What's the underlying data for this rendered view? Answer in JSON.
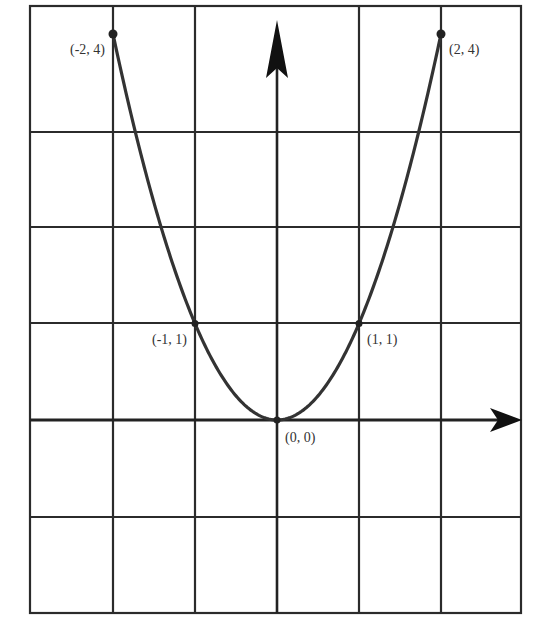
{
  "chart_data": {
    "type": "line",
    "title": "",
    "function": "y = x^2",
    "xlabel": "",
    "ylabel": "",
    "xlim": [
      -2,
      2
    ],
    "ylim": [
      -2,
      4
    ],
    "grid": true,
    "grid_columns": 6,
    "grid_rows": 6,
    "axes_arrows": [
      "positive-x",
      "positive-y"
    ],
    "series": [
      {
        "name": "parabola",
        "x": [
          -2,
          -1,
          0,
          1,
          2
        ],
        "y": [
          4,
          1,
          0,
          1,
          4
        ]
      }
    ],
    "annotations": [
      {
        "x": -2,
        "y": 4,
        "text": "(-2, 4)",
        "position": "below-left"
      },
      {
        "x": 2,
        "y": 4,
        "text": "(2, 4)",
        "position": "below-right"
      },
      {
        "x": -1,
        "y": 1,
        "text": "(-1, 1)",
        "position": "below-left"
      },
      {
        "x": 1,
        "y": 1,
        "text": "(1, 1)",
        "position": "below-right"
      },
      {
        "x": 0,
        "y": 0,
        "text": "(0, 0)",
        "position": "below-right"
      }
    ],
    "colors": {
      "line": "#333333",
      "grid": "#2b2b2b",
      "background": "#ffffff"
    }
  }
}
